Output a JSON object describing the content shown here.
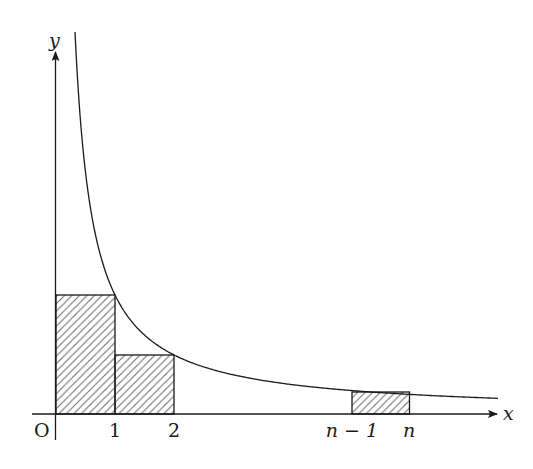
{
  "figure": {
    "axes": {
      "x_label": "x",
      "y_label": "y",
      "origin_label": "O"
    },
    "tick_labels": [
      "1",
      "2",
      "n − 1",
      "n"
    ],
    "curve": {
      "function": "y = 1/x",
      "domain_visible": [
        0.3,
        7.5
      ]
    },
    "rectangles": [
      {
        "name": "rect-0-1",
        "x_from": "0",
        "x_to": "1",
        "height": "f(1)",
        "hatched": true
      },
      {
        "name": "rect-1-2",
        "x_from": "1",
        "x_to": "2",
        "height": "f(2)",
        "hatched": true
      },
      {
        "name": "rect-n",
        "x_from": "n − 1",
        "x_to": "n",
        "height": "f(n)",
        "hatched": true
      }
    ],
    "colors": {
      "stroke": "#1a1a1a",
      "hatch": "#6e6e6e",
      "background": "#ffffff"
    }
  }
}
